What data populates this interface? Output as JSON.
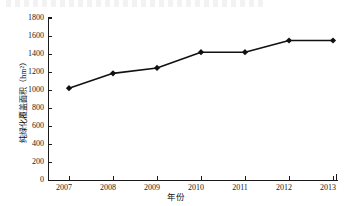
{
  "chart_data": {
    "type": "line",
    "title": "",
    "xlabel": "年份",
    "ylabel": "纯绿化覆盖面积（hm²）",
    "categories": [
      "2007",
      "2008",
      "2009",
      "2010",
      "2011",
      "2012",
      "2013"
    ],
    "values": [
      1020,
      1185,
      1245,
      1420,
      1420,
      1550,
      1550
    ],
    "series": [
      {
        "name": "纯绿化覆盖面积",
        "values": [
          1020,
          1185,
          1245,
          1420,
          1420,
          1550,
          1550
        ]
      }
    ],
    "ylim": [
      0,
      1800
    ],
    "yticks": [
      0,
      200,
      400,
      600,
      800,
      1000,
      1200,
      1400,
      1600,
      1800
    ],
    "ytick_labels": [
      "0",
      "200",
      "400",
      "600",
      "800",
      "1000",
      "1200",
      "1400",
      "1600",
      "1800"
    ],
    "xtick_labels": [
      "2007",
      "2008",
      "2009",
      "2010",
      "2011",
      "2012",
      "2013"
    ],
    "grid": false,
    "legend": "none",
    "marker": "diamond",
    "line_color": "#111111",
    "marker_color": "#111111"
  }
}
